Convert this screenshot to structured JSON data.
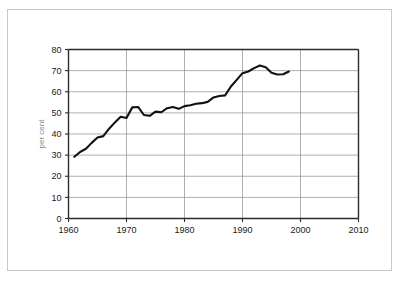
{
  "chart_data": {
    "type": "line",
    "title": "",
    "subtitle": "",
    "xlabel": "",
    "ylabel": "per cent",
    "xlim": [
      1960,
      2010
    ],
    "ylim": [
      0,
      80
    ],
    "grid": true,
    "grid_axis": "y",
    "legend": false,
    "legend_position": "none",
    "x_ticks": [
      1960,
      1970,
      1980,
      1990,
      2000,
      2010
    ],
    "x_tick_labels": [
      "1960",
      "1970",
      "1980",
      "1990",
      "2000",
      "2010"
    ],
    "y_ticks": [
      0,
      10,
      20,
      30,
      40,
      50,
      60,
      70,
      80
    ],
    "y_tick_labels": [
      "0",
      "10",
      "20",
      "30",
      "40",
      "50",
      "60",
      "70",
      "80"
    ],
    "line_color": "#111111",
    "series": [
      {
        "name": "series-1",
        "x": [
          1961,
          1962,
          1963,
          1964,
          1965,
          1966,
          1967,
          1968,
          1969,
          1970,
          1971,
          1972,
          1973,
          1974,
          1975,
          1976,
          1977,
          1978,
          1979,
          1980,
          1981,
          1982,
          1983,
          1984,
          1985,
          1986,
          1987,
          1988,
          1989,
          1990,
          1991,
          1992,
          1993,
          1994,
          1995,
          1996,
          1997,
          1998
        ],
        "values": [
          29.2,
          31.5,
          33.0,
          35.8,
          38.3,
          39.0,
          42.5,
          45.5,
          48.2,
          47.6,
          52.6,
          52.8,
          49.0,
          48.6,
          50.6,
          50.3,
          52.2,
          52.8,
          51.9,
          53.2,
          53.6,
          54.3,
          54.6,
          55.2,
          57.3,
          58.0,
          58.3,
          62.5,
          65.6,
          68.8,
          69.6,
          71.2,
          72.4,
          71.6,
          69.0,
          68.2,
          68.3,
          69.6
        ]
      }
    ]
  },
  "axis": {
    "y_title": "per cent"
  },
  "colors": {
    "line": "#111111",
    "grid": "#8c8c8c",
    "axis": "#2b2b2b",
    "page_border": "#c8c8c8",
    "background": "#ffffff",
    "axis_title": "#8a8a8a"
  }
}
